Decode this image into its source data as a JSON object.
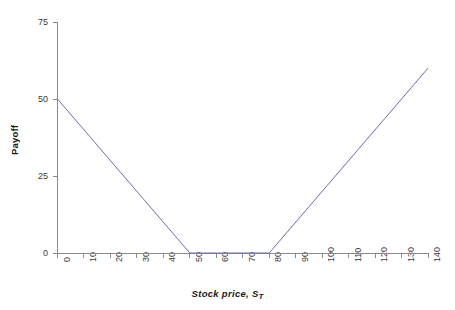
{
  "chart_data": {
    "type": "line",
    "title": "",
    "subtitle": "",
    "xlabel": "Stock price, S",
    "xlabel_subscript": "T",
    "ylabel": "Payoff",
    "xlim": [
      0,
      140
    ],
    "ylim": [
      0,
      75
    ],
    "xticks": [
      0,
      10,
      20,
      30,
      40,
      50,
      60,
      70,
      80,
      90,
      100,
      110,
      120,
      130,
      140
    ],
    "yticks": [
      0,
      25,
      50,
      75
    ],
    "xtick_labels": [
      "0",
      "10",
      "20",
      "30",
      "40",
      "50",
      "60",
      "70",
      "80",
      "90",
      "100",
      "110",
      "120",
      "130",
      "140"
    ],
    "ytick_labels": [
      "0",
      "25",
      "50",
      "75"
    ],
    "xtick_label_rotation": 90,
    "grid": false,
    "legend": false,
    "legend_position": "none",
    "series": [
      {
        "name": "Payoff",
        "color": "#6d6dae",
        "line_width": 1,
        "x": [
          0,
          50,
          80,
          140
        ],
        "values": [
          50,
          0,
          0,
          60
        ]
      }
    ],
    "annotations": [],
    "breakpoints": [
      {
        "x": 50,
        "y": 0,
        "note": "put strike"
      },
      {
        "x": 80,
        "y": 0,
        "note": "call strike"
      }
    ]
  },
  "axes": {
    "spine_color": "#8a8a8a",
    "tick_color": "#8a8a8a",
    "tick_label_color": "#3a3a3a",
    "label_color": "#1a1a1a"
  },
  "figure": {
    "background": "#ffffff",
    "width": 455,
    "height": 310
  }
}
